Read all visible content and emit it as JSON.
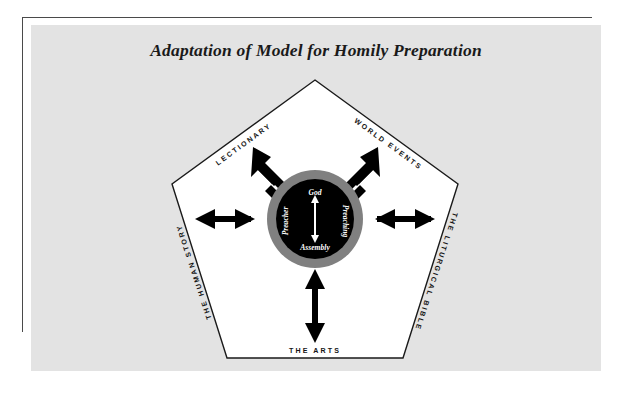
{
  "page": {
    "title": "Adaptation of Model for Homily Preparation",
    "background_color": "#ffffff",
    "plate_color": "#e3e3e3",
    "rule_color": "#4a4a4a"
  },
  "diagram": {
    "type": "pentagon-radial-model",
    "shape": "pentagon",
    "shape_fill": "#ffffff",
    "shape_stroke": "#1a1a1a",
    "center": {
      "ring_color": "#808080",
      "disc_color": "#000000",
      "labels": {
        "top": "God",
        "bottom": "Assembly",
        "left": "Preacher",
        "right": "Preaching"
      },
      "inner_arrow": {
        "color": "#ffffff",
        "direction": "double",
        "orientation": "vertical"
      }
    },
    "arrow_color": "#000000",
    "arrow_style": "double-headed",
    "nodes": [
      {
        "id": "lectionary",
        "label": "LECTIONARY",
        "position": "upper-left"
      },
      {
        "id": "world-events",
        "label": "WORLD EVENTS",
        "position": "upper-right"
      },
      {
        "id": "liturgical-bible",
        "label": "THE LITURGICAL BIBLE",
        "position": "right"
      },
      {
        "id": "the-arts",
        "label": "THE ARTS",
        "position": "bottom"
      },
      {
        "id": "human-story",
        "label": "THE HUMAN STORY",
        "position": "left"
      }
    ]
  }
}
